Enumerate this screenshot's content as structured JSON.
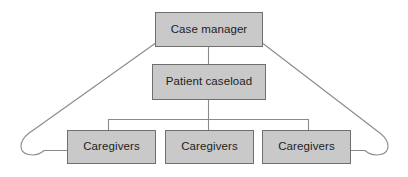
{
  "diagram": {
    "type": "hierarchy-flow-diagram",
    "background_color": "#ffffff",
    "node_fill_color": "#c9c9c9",
    "node_border_color": "#6f6f6f",
    "connector_color": "#8a8a8a",
    "nodes": [
      {
        "id": "case-manager",
        "label": "Case manager",
        "level": 1
      },
      {
        "id": "patient-caseload",
        "label": "Patient caseload",
        "level": 2
      },
      {
        "id": "caregivers-left",
        "label": "Caregivers",
        "level": 3
      },
      {
        "id": "caregivers-mid",
        "label": "Caregivers",
        "level": 3
      },
      {
        "id": "caregivers-right",
        "label": "Caregivers",
        "level": 3
      }
    ],
    "connectors": [
      {
        "id": "cm-to-pc",
        "from": "case-manager",
        "to": "patient-caseload",
        "style": "straight-vertical"
      },
      {
        "id": "pc-to-bracket",
        "from": "patient-caseload",
        "to": "caregivers-mid",
        "style": "straight-vertical"
      },
      {
        "id": "bracket-to-left",
        "from": "patient-caseload",
        "to": "caregivers-left",
        "style": "orthogonal-bracket"
      },
      {
        "id": "bracket-to-right",
        "from": "patient-caseload",
        "to": "caregivers-right",
        "style": "orthogonal-bracket"
      },
      {
        "id": "cm-loop-left",
        "from": "case-manager",
        "to": "caregivers-left",
        "style": "diagonal-with-u-curve"
      },
      {
        "id": "cm-loop-right",
        "from": "case-manager",
        "to": "caregivers-right",
        "style": "diagonal-with-u-curve"
      }
    ]
  }
}
